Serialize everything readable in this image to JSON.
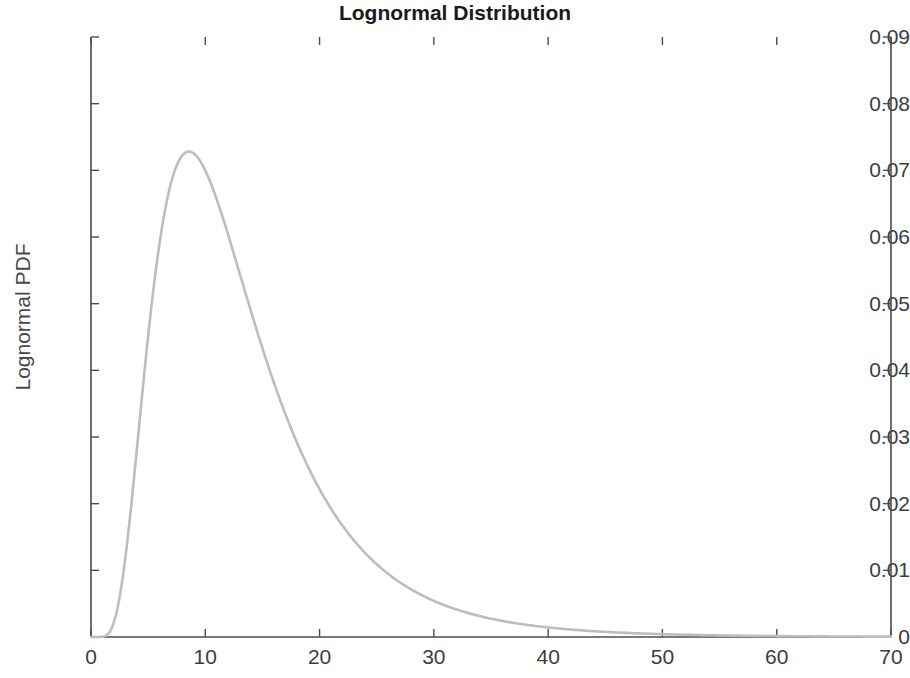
{
  "chart_data": {
    "type": "line",
    "title": "Lognormal Distribution",
    "xlabel": "",
    "ylabel": "Lognormal PDF",
    "xlim": [
      0,
      70
    ],
    "ylim": [
      0,
      0.09
    ],
    "grid": false,
    "legend": null,
    "line_color": "#bdbdbd",
    "distribution": {
      "name": "lognormal",
      "mu": 2.45,
      "sigma": 0.55,
      "mode_x": 9.8,
      "mode_y": 0.0812
    },
    "xticks": [
      0,
      10,
      20,
      30,
      40,
      50,
      60,
      70
    ],
    "xtick_labels": [
      "0",
      "10",
      "20",
      "30",
      "40",
      "50",
      "60",
      "70"
    ],
    "yticks": [
      0,
      0.01,
      0.02,
      0.03,
      0.04,
      0.05,
      0.06,
      0.07,
      0.08,
      0.09
    ],
    "ytick_labels": [
      "0",
      "0.01",
      "0.02",
      "0.03",
      "0.04",
      "0.05",
      "0.06",
      "0.07",
      "0.08",
      "0.09"
    ],
    "x": [
      0,
      1,
      2,
      2.7,
      3,
      4,
      5,
      6,
      7,
      8,
      9,
      9.8,
      10,
      11,
      12,
      13,
      14,
      15,
      16,
      17,
      18,
      19,
      20,
      22,
      24,
      26,
      28,
      30,
      32,
      34,
      36,
      38,
      40,
      42,
      45,
      48,
      50,
      55,
      60,
      65,
      70
    ],
    "values": [
      0,
      1e-05,
      0.00061,
      0.00267,
      0.00385,
      0.01205,
      0.02443,
      0.03822,
      0.05139,
      0.06247,
      0.07074,
      0.07613,
      0.07706,
      0.08073,
      0.08154,
      0.08115,
      0.07897,
      0.07579,
      0.07199,
      0.06786,
      0.06362,
      0.05941,
      0.05532,
      0.04779,
      0.04121,
      0.03557,
      0.03077,
      0.02671,
      0.02327,
      0.02035,
      0.01786,
      0.01573,
      0.01391,
      0.01234,
      0.01034,
      0.00873,
      0.00783,
      0.00596,
      0.00461,
      0.00362,
      0.00288
    ]
  },
  "axes": {
    "plot_left": 91,
    "plot_top": 37,
    "plot_right": 891,
    "plot_bottom": 637,
    "axis_color": "#4d4d4d"
  }
}
